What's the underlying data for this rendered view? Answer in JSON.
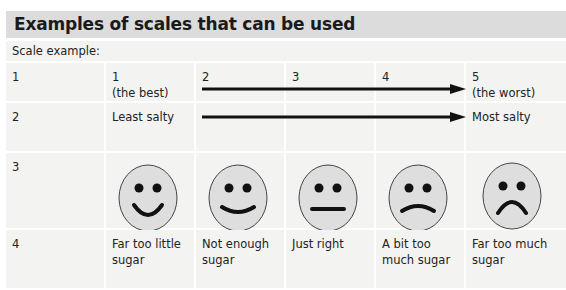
{
  "title": "Examples of scales that can be used",
  "caption": "Scale example:",
  "rows": [
    {
      "label": "1",
      "points": [
        {
          "value": "1",
          "note": "(the best)"
        },
        {
          "value": "2"
        },
        {
          "value": "3"
        },
        {
          "value": "4"
        },
        {
          "value": "5",
          "note": "(the worst)"
        }
      ]
    },
    {
      "label": "2",
      "start": "Least salty",
      "end": "Most salty"
    },
    {
      "label": "3",
      "faces": [
        "very-happy-face-icon",
        "happy-face-icon",
        "neutral-face-icon",
        "sad-face-icon",
        "very-sad-face-icon"
      ]
    },
    {
      "label": "4",
      "options": [
        "Far too little sugar",
        "Not enough sugar",
        "Just right",
        "A bit too much sugar",
        "Far too much sugar"
      ]
    }
  ],
  "colors": {
    "title_bg": "#dcdcdc",
    "cell_bg": "#f3f4f2",
    "face_fill": "#dedede"
  }
}
